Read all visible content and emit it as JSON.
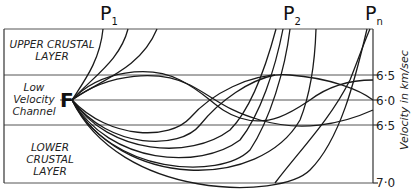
{
  "diagram": {
    "type": "seismic ray paths in layered crust",
    "stations": [
      {
        "label": "P",
        "sub": "1"
      },
      {
        "label": "P",
        "sub": "2"
      },
      {
        "label": "P",
        "sub": "n"
      }
    ],
    "source_label": "F",
    "layers": {
      "upper": [
        "UPPER CRUSTAL",
        "LAYER"
      ],
      "channel": [
        "Low",
        "Velocity",
        "Channel"
      ],
      "lower": [
        "LOWER",
        "CRUSTAL LAYER"
      ]
    },
    "axis": {
      "title": "Velocity in km/sec",
      "ticks": [
        "6·5",
        "6·0",
        "6·5",
        "7·0"
      ]
    },
    "colors": {
      "line": "#1a1a1a",
      "grid": "#555555",
      "background": "#ffffff"
    }
  }
}
